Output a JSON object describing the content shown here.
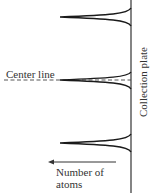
{
  "diagram": {
    "labels": {
      "center_line": "Center line",
      "collection_plate": "Collection plate",
      "number_of_atoms": "Number of atoms"
    },
    "peaks": [
      {
        "name": "top",
        "center_y": 17
      },
      {
        "name": "middle",
        "center_y": 80
      },
      {
        "name": "bottom",
        "center_y": 143
      }
    ],
    "colors": {
      "line": "#1a1a1a",
      "text": "#333333"
    }
  }
}
